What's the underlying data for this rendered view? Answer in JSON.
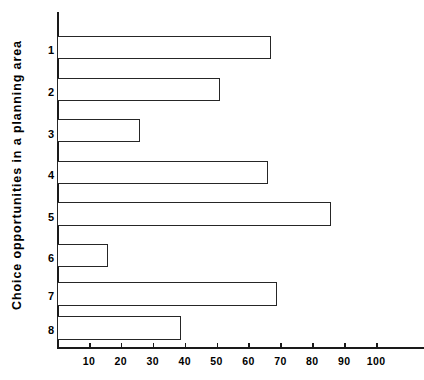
{
  "chart_data": {
    "type": "bar",
    "orientation": "horizontal",
    "title": "",
    "subtitle": "",
    "xlabel": "",
    "ylabel": "Choice opportunities in a planning area",
    "categories": [
      "1",
      "2",
      "3",
      "4",
      "5",
      "6",
      "7",
      "8"
    ],
    "values": [
      67,
      51,
      26,
      66,
      86,
      16,
      69,
      39
    ],
    "series": [
      {
        "name": "Choice opportunities",
        "values": [
          67,
          51,
          26,
          66,
          86,
          16,
          69,
          39
        ]
      }
    ],
    "xlim": [
      0,
      115
    ],
    "ylim": [
      0,
      8
    ],
    "xticks": [
      10,
      20,
      30,
      40,
      50,
      60,
      70,
      80,
      90,
      100
    ],
    "xtick_labels": [
      "10",
      "20",
      "30",
      "40",
      "50",
      "60",
      "70",
      "80",
      "90",
      "100"
    ],
    "ytick_labels": [
      "1",
      "2",
      "3",
      "4",
      "5",
      "6",
      "7",
      "8"
    ],
    "grid": false,
    "legend": false,
    "legend_position": "none",
    "bar_fill_color": "#ffffff",
    "bar_edge_color": "#262626",
    "axis_color": "#1a1a1a",
    "background_color": "#ffffff",
    "annotations": []
  },
  "axes": {
    "y_title": "Choice opportunities in a planning area"
  }
}
